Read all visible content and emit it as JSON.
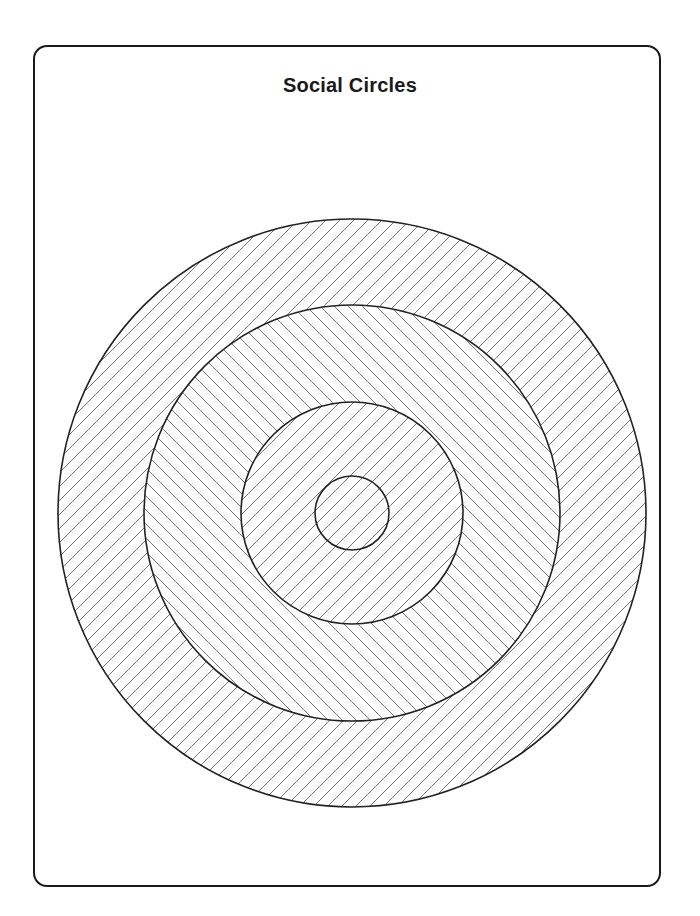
{
  "page": {
    "title": "Social Circles"
  },
  "diagram": {
    "type": "concentric-circles",
    "center": [
      352,
      513
    ],
    "rings": [
      {
        "name": "outer-circle",
        "radius": 294,
        "hatch": "forward"
      },
      {
        "name": "second-circle",
        "radius": 208,
        "hatch": "backward"
      },
      {
        "name": "third-circle",
        "radius": 111,
        "hatch": "forward"
      },
      {
        "name": "inner-circle",
        "radius": 37,
        "hatch": "forward"
      }
    ],
    "stroke_color": "#222222",
    "hatch_color": "#555555"
  }
}
